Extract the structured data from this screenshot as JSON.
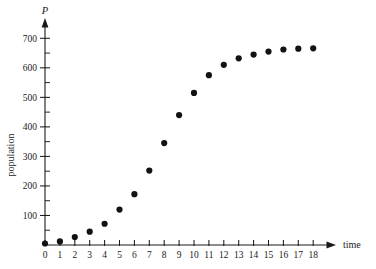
{
  "chart_data": {
    "type": "scatter",
    "title": "",
    "xlabel": "time",
    "ylabel": "population",
    "y_axis_symbol": "P",
    "x": [
      0,
      1,
      2,
      3,
      4,
      5,
      6,
      7,
      8,
      9,
      10,
      11,
      12,
      13,
      14,
      15,
      16,
      17,
      18
    ],
    "values": [
      5,
      12,
      27,
      45,
      72,
      120,
      172,
      252,
      345,
      440,
      515,
      575,
      610,
      632,
      645,
      655,
      662,
      665,
      666
    ],
    "xlim": [
      0,
      18
    ],
    "ylim": [
      0,
      740
    ],
    "x_ticks": [
      0,
      1,
      2,
      3,
      4,
      5,
      6,
      7,
      8,
      9,
      10,
      11,
      12,
      13,
      14,
      15,
      16,
      17,
      18
    ],
    "x_tick_labels": [
      "0",
      "1",
      "2",
      "3",
      "4",
      "5",
      "6",
      "7",
      "8",
      "9",
      "10",
      "11",
      "12",
      "13",
      "14",
      "15",
      "16",
      "17",
      "18"
    ],
    "y_ticks_major": [
      100,
      200,
      300,
      400,
      500,
      600,
      700
    ],
    "y_tick_labels": [
      "100",
      "200",
      "300",
      "400",
      "500",
      "600",
      "700"
    ],
    "y_ticks_minor": [
      50,
      150,
      250,
      350,
      450,
      550,
      650
    ],
    "grid": false,
    "legend": false,
    "marker_color": "#121212",
    "axis_color": "#1a1a1a",
    "background_color": "#ffffff"
  }
}
